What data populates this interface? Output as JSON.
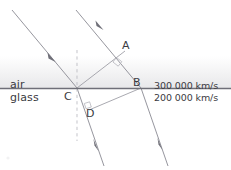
{
  "figure": {
    "width": 231,
    "height": 170,
    "background": "#ffffff",
    "line_color": "#8a8a93",
    "boundary_color": "#6f6f78",
    "text_color": "#3b3b42",
    "air_band_color": "#ececed"
  },
  "media": {
    "upper": {
      "name": "air",
      "speed": "300 000 km/s"
    },
    "lower": {
      "name": "glass",
      "speed": "200 000 km/s"
    }
  },
  "points": [
    {
      "id": "A",
      "label": "A",
      "x": 124,
      "y": 52
    },
    {
      "id": "B",
      "label": "B",
      "x": 141,
      "y": 88
    },
    {
      "id": "C",
      "label": "C",
      "x": 77,
      "y": 88
    },
    {
      "id": "D",
      "label": "D",
      "x": 89,
      "y": 110
    }
  ],
  "labels": {
    "air": "air",
    "glass": "glass",
    "speed_air": "300 000 km/s",
    "speed_glass": "200 000 km/s",
    "point_a": "A",
    "point_b": "B",
    "point_c": "C",
    "point_d": "D"
  },
  "geometry": {
    "boundary": {
      "x1": 0,
      "y1": 88,
      "x2": 231,
      "y2": 88
    },
    "normal": {
      "x1": 77,
      "y1": 50,
      "x2": 77,
      "y2": 140,
      "style": "dashed"
    },
    "incident_rays": [
      {
        "name": "incident-ray-1",
        "x1": 12,
        "y1": 10,
        "x2": 77,
        "y2": 88
      },
      {
        "name": "incident-ray-2",
        "x1": 76,
        "y1": 10,
        "x2": 141,
        "y2": 88
      }
    ],
    "refracted_rays": [
      {
        "name": "refracted-ray-1",
        "x1": 77,
        "y1": 88,
        "x2": 104,
        "y2": 166
      },
      {
        "name": "refracted-ray-2",
        "x1": 141,
        "y1": 88,
        "x2": 168,
        "y2": 166
      }
    ],
    "wavefront_air": {
      "name": "wavefront-CA",
      "x1": 77,
      "y1": 88,
      "x2": 124,
      "y2": 52
    },
    "wavefront_glass": {
      "name": "wavefront-DB",
      "x1": 89,
      "y1": 110,
      "x2": 141,
      "y2": 88
    },
    "right_angles": [
      {
        "name": "right-angle-at-A",
        "x": 124,
        "y": 52
      },
      {
        "name": "right-angle-at-D",
        "x": 89,
        "y": 110
      }
    ],
    "arrowheads": [
      {
        "on": "incident-ray-1",
        "x": 51,
        "y": 57
      },
      {
        "on": "incident-ray-2",
        "x": 99,
        "y": 25
      },
      {
        "on": "refracted-ray-1",
        "x": 96,
        "y": 145
      },
      {
        "on": "refracted-ray-2",
        "x": 160,
        "y": 144
      }
    ]
  }
}
